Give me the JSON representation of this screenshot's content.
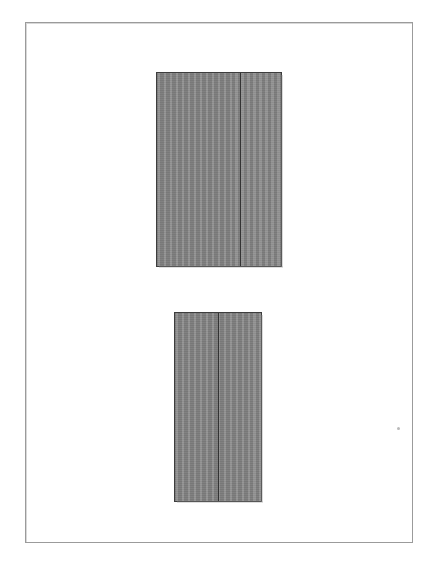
{
  "page": {
    "width": 435,
    "height": 564,
    "background_color": "#ffffff",
    "document_type": "scanned technical drawing",
    "visible_text": ""
  },
  "frame": {
    "name": "page border rule",
    "left": 25,
    "top": 22,
    "width": 388,
    "height": 521,
    "border_color": "#9b9b9b",
    "border_width_px": 1,
    "ghost_color": "#d8d8d8"
  },
  "shapes": [
    {
      "id": "upper-block",
      "label": "upper shaded rectangle",
      "left": 156,
      "top": 72,
      "width": 126,
      "height": 195,
      "fill_color": "#868686",
      "outline_color": "#3d3d3d",
      "outline_width_px": 1,
      "divider": {
        "label": "vertical division line",
        "offset_from_left": 83,
        "color": "#333333",
        "width_px": 1
      },
      "panels": [
        {
          "label": "left panel",
          "width": 83
        },
        {
          "label": "right panel",
          "width": 42
        }
      ]
    },
    {
      "id": "lower-block",
      "label": "lower shaded rectangle",
      "left": 174,
      "top": 312,
      "width": 88,
      "height": 190,
      "fill_color": "#868686",
      "outline_color": "#3d3d3d",
      "outline_width_px": 1,
      "divider": {
        "label": "vertical division line",
        "offset_from_left": 43,
        "color": "#333333",
        "width_px": 1
      },
      "panels": [
        {
          "label": "left panel",
          "width": 43
        },
        {
          "label": "right panel",
          "width": 44
        }
      ]
    }
  ],
  "artifacts": [
    {
      "id": "scan-speck",
      "label": "scanner dust speck",
      "left": 397,
      "top": 427,
      "size": 3,
      "color": "#b9b9b9"
    }
  ]
}
